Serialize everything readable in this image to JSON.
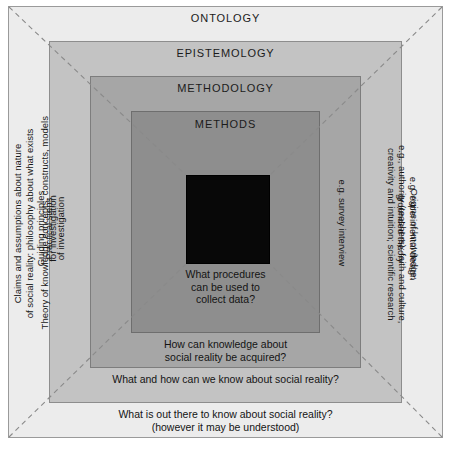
{
  "diagram": {
    "layers": [
      {
        "id": "ontology",
        "name": "ONTOLOGY",
        "fill": "#ececec",
        "question": "What is out there to know about social reality?\n(however it may be understood)",
        "left_label": "Claims and assumptions about nature\nof social reality: philosophy about what exists",
        "right_label": "Concerned with ways of being and thinking about social reality"
      },
      {
        "id": "epistemology",
        "name": "EPISTEMOLOGY",
        "fill": "#c3c3c3",
        "question": "What and how can we know about social reality?",
        "left_label": "Theory of knowledge concepts, constructs, models",
        "right_label": "Origins of knowledge:\ne.g., authority (teachers); faith and culture,\ncreativity and intuition; scientific research"
      },
      {
        "id": "methodology",
        "name": "METHODOLOGY",
        "fill": "#a6a6a6",
        "question": "How can knowledge about\nsocial reality be acquired?",
        "left_label": "Guiding principles\nfor investigation",
        "right_label": "e.g. experimental design\ngrounded theory"
      },
      {
        "id": "methods",
        "name": "METHODS",
        "fill": "#8e8e8e",
        "question": "What procedures\ncan be used to\ncollect data?",
        "left_label": "Practical steps\nof investigation",
        "right_label": "e.g. survey interview"
      }
    ],
    "core": {
      "id": "core",
      "fill": "#080808",
      "label": ""
    },
    "caption": "",
    "colors": {
      "outline": "#8c8c8c",
      "diagonal_guide": "#8a8a8a",
      "text": "#171717",
      "page_background": "#ffffff"
    }
  }
}
